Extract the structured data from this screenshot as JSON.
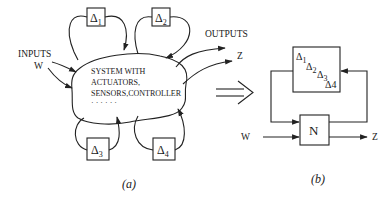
{
  "diagram": {
    "panel_a": {
      "caption": "(a)",
      "inputs_label": "INPUTS",
      "input_signal": "W",
      "outputs_label": "OUTPUTS",
      "output_signal": "Z",
      "system_text": {
        "line1": "SYSTEM WITH",
        "line2": "ACTUATORS,",
        "line3": "SENSORS,CONTROLLER",
        "line4": "· · · · · ·"
      },
      "uncertainty_blocks": [
        {
          "symbol": "Δ",
          "index": "1"
        },
        {
          "symbol": "Δ",
          "index": "2"
        },
        {
          "symbol": "Δ",
          "index": "3"
        },
        {
          "symbol": "Δ",
          "index": "4"
        }
      ]
    },
    "transform_arrow": "⟹",
    "panel_b": {
      "caption": "(b)",
      "plant_label": "N",
      "input_signal": "W",
      "output_signal": "Z",
      "delta_block": [
        {
          "symbol": "Δ",
          "index": "1"
        },
        {
          "symbol": "Δ",
          "index": "2"
        },
        {
          "symbol": "Δ",
          "index": "3"
        },
        {
          "symbol": "Δ",
          "index": "4"
        }
      ]
    }
  }
}
